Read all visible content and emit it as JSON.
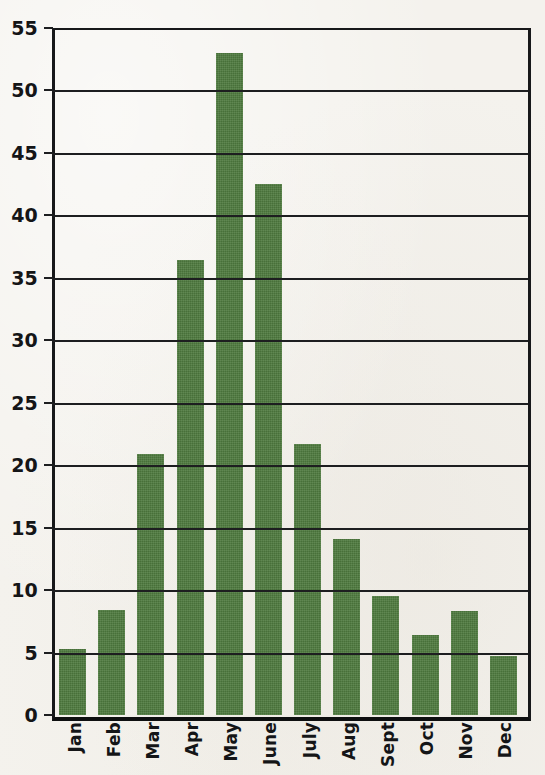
{
  "chart_data": {
    "type": "bar",
    "title": "",
    "subtitle": "",
    "xlabel": "",
    "ylabel": "",
    "categories": [
      "Jan",
      "Feb",
      "Mar",
      "Apr",
      "May",
      "June",
      "July",
      "Aug",
      "Sept",
      "Oct",
      "Nov",
      "Dec"
    ],
    "values": [
      5.3,
      8.4,
      20.9,
      36.4,
      53.0,
      42.5,
      21.7,
      14.1,
      9.5,
      6.4,
      8.3,
      4.7
    ],
    "series": [
      {
        "name": "",
        "values": [
          5.3,
          8.4,
          20.9,
          36.4,
          53.0,
          42.5,
          21.7,
          14.1,
          9.5,
          6.4,
          8.3,
          4.7
        ]
      }
    ],
    "ylim": [
      0,
      55
    ],
    "xlim": [
      0,
      12
    ],
    "y_ticks": [
      0,
      5,
      10,
      15,
      20,
      25,
      30,
      35,
      40,
      45,
      50,
      55
    ],
    "y_tick_labels": [
      "0",
      "5",
      "10",
      "15",
      "20",
      "25",
      "30",
      "35",
      "40",
      "45",
      "50",
      "55"
    ],
    "grid": true,
    "grid_axis": "y",
    "legend": false,
    "legend_position": "none",
    "annotations": [],
    "bar_color": "#4e7a3e",
    "axis_color": "#17181a",
    "background_color": "#f4f2ed",
    "x_tick_label_rotation": 90
  }
}
